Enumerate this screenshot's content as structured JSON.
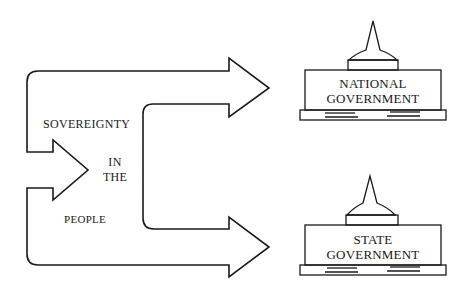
{
  "diagram": {
    "flow_labels": {
      "line1": "SOVEREIGNTY",
      "line2": "IN",
      "line3": "THE",
      "line4": "PEOPLE"
    },
    "targets": [
      {
        "line1": "NATIONAL",
        "line2": "GOVERNMENT"
      },
      {
        "line1": "STATE",
        "line2": "GOVERNMENT"
      }
    ],
    "colors": {
      "stroke": "#1a1a1a",
      "background": "#ffffff"
    }
  }
}
